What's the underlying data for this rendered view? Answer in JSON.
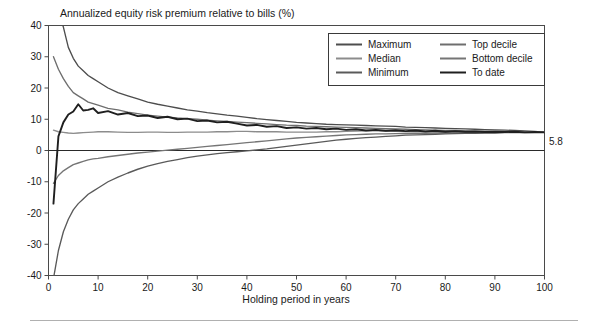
{
  "figure": {
    "title": "Annualized equity risk premium relative to bills (%)",
    "footer_rule": true
  },
  "chart_data": {
    "type": "line",
    "title": "Annualized equity risk premium relative to bills (%)",
    "xlabel": "Holding period in years",
    "ylabel": "",
    "xlim": [
      0,
      100
    ],
    "ylim": [
      -40,
      40
    ],
    "grid": false,
    "legend_position": "top-right",
    "xticks": [
      0,
      10,
      20,
      30,
      40,
      50,
      60,
      70,
      80,
      90,
      100
    ],
    "yticks": [
      -40,
      -30,
      -20,
      -10,
      0,
      10,
      20,
      30,
      40
    ],
    "xtick_labels": [
      "0",
      "10",
      "20",
      "30",
      "40",
      "50",
      "60",
      "70",
      "80",
      "90",
      "100"
    ],
    "ytick_labels": [
      "-40",
      "-30",
      "-20",
      "-10",
      "0",
      "10",
      "20",
      "30",
      "40"
    ],
    "annotations": [
      {
        "text": "5.8",
        "x": 100,
        "y": 5.8,
        "position": "right-of-axis"
      }
    ],
    "x": [
      1,
      2,
      3,
      4,
      5,
      6,
      7,
      8,
      9,
      10,
      12,
      14,
      16,
      18,
      20,
      22,
      24,
      26,
      28,
      30,
      32,
      34,
      36,
      38,
      40,
      42,
      44,
      46,
      48,
      50,
      52,
      54,
      56,
      58,
      60,
      62,
      64,
      66,
      68,
      70,
      72,
      74,
      76,
      78,
      80,
      82,
      84,
      86,
      88,
      90,
      92,
      94,
      96,
      98,
      100
    ],
    "series": [
      {
        "name": "Maximum",
        "color": "#4d4d4d",
        "values": [
          57.0,
          44.0,
          39.5,
          33.0,
          29.5,
          27.0,
          25.5,
          24.0,
          23.0,
          22.0,
          20.0,
          18.5,
          17.5,
          16.5,
          15.5,
          14.8,
          14.2,
          13.6,
          13.0,
          12.6,
          12.1,
          11.7,
          11.3,
          11.0,
          10.6,
          10.2,
          9.9,
          9.6,
          9.3,
          9.0,
          8.8,
          8.6,
          8.4,
          8.3,
          8.2,
          8.1,
          8.0,
          7.9,
          7.8,
          7.7,
          7.5,
          7.4,
          7.3,
          7.2,
          7.1,
          7.0,
          6.9,
          6.8,
          6.7,
          6.6,
          6.5,
          6.4,
          6.3,
          6.1,
          5.9
        ]
      },
      {
        "name": "Top decile",
        "color": "#6e6e6e",
        "values": [
          30.0,
          26.0,
          23.0,
          20.5,
          18.5,
          17.5,
          16.5,
          15.5,
          15.0,
          14.5,
          13.5,
          13.0,
          12.3,
          11.8,
          11.3,
          11.0,
          10.7,
          10.4,
          10.2,
          10.0,
          9.7,
          9.5,
          9.3,
          9.1,
          8.9,
          8.7,
          8.5,
          8.3,
          8.1,
          8.0,
          7.8,
          7.7,
          7.6,
          7.5,
          7.4,
          7.3,
          7.2,
          7.1,
          7.0,
          6.9,
          6.8,
          6.7,
          6.6,
          6.5,
          6.4,
          6.4,
          6.3,
          6.2,
          6.2,
          6.1,
          6.1,
          6.0,
          6.0,
          5.9,
          5.9
        ]
      },
      {
        "name": "Median",
        "color": "#8c8c8c",
        "values": [
          6.5,
          6.0,
          5.8,
          5.6,
          5.5,
          5.6,
          5.7,
          5.8,
          5.9,
          6.0,
          6.0,
          5.9,
          5.8,
          5.8,
          5.9,
          5.9,
          5.8,
          5.8,
          5.9,
          5.9,
          5.9,
          6.0,
          6.0,
          6.1,
          6.1,
          6.0,
          6.0,
          6.0,
          5.9,
          5.9,
          5.9,
          5.9,
          6.0,
          6.0,
          6.1,
          6.2,
          6.3,
          6.3,
          6.2,
          6.1,
          6.0,
          6.0,
          6.0,
          6.0,
          5.9,
          5.9,
          5.9,
          5.9,
          5.9,
          5.8,
          5.8,
          5.8,
          5.8,
          5.8,
          5.8
        ]
      },
      {
        "name": "Bottom decile",
        "color": "#757575",
        "values": [
          -10.5,
          -8.0,
          -6.5,
          -5.5,
          -4.5,
          -4.0,
          -3.5,
          -3.0,
          -2.7,
          -2.5,
          -2.0,
          -1.6,
          -1.2,
          -0.8,
          -0.5,
          -0.2,
          0.1,
          0.4,
          0.7,
          1.0,
          1.3,
          1.6,
          1.9,
          2.2,
          2.5,
          2.8,
          3.1,
          3.4,
          3.7,
          4.0,
          4.2,
          4.4,
          4.6,
          4.8,
          5.0,
          5.1,
          5.2,
          5.3,
          5.3,
          5.4,
          5.4,
          5.5,
          5.5,
          5.6,
          5.6,
          5.6,
          5.7,
          5.7,
          5.7,
          5.7,
          5.8,
          5.8,
          5.8,
          5.8,
          5.8
        ]
      },
      {
        "name": "Minimum",
        "color": "#5a5a5a",
        "values": [
          -41.0,
          -32.0,
          -26.0,
          -22.0,
          -19.0,
          -17.0,
          -15.5,
          -14.0,
          -13.0,
          -12.0,
          -10.0,
          -8.5,
          -7.2,
          -6.0,
          -5.0,
          -4.2,
          -3.5,
          -2.9,
          -2.3,
          -1.8,
          -1.4,
          -1.0,
          -0.7,
          -0.4,
          -0.1,
          0.2,
          0.5,
          0.9,
          1.3,
          1.7,
          2.1,
          2.5,
          2.9,
          3.3,
          3.6,
          3.9,
          4.1,
          4.3,
          4.5,
          4.7,
          4.9,
          5.0,
          5.1,
          5.2,
          5.3,
          5.4,
          5.5,
          5.5,
          5.6,
          5.6,
          5.7,
          5.7,
          5.7,
          5.8,
          5.8
        ]
      },
      {
        "name": "To date",
        "color": "#1f1f1f",
        "values": [
          -17.0,
          4.5,
          9.0,
          11.5,
          12.5,
          14.8,
          12.8,
          13.0,
          13.5,
          12.0,
          12.6,
          11.5,
          12.0,
          11.0,
          11.2,
          10.4,
          10.8,
          10.0,
          10.2,
          9.4,
          9.6,
          9.0,
          9.2,
          8.6,
          8.0,
          8.2,
          7.6,
          7.8,
          7.2,
          7.4,
          7.0,
          7.2,
          6.8,
          7.0,
          6.6,
          6.8,
          6.4,
          6.6,
          6.3,
          6.5,
          6.2,
          6.4,
          6.1,
          6.3,
          6.0,
          6.2,
          6.0,
          6.1,
          5.9,
          6.0,
          5.9,
          6.0,
          5.8,
          5.9,
          5.8
        ]
      }
    ],
    "legend": [
      {
        "label": "Maximum",
        "color": "#4d4d4d",
        "column": 0
      },
      {
        "label": "Median",
        "color": "#8c8c8c",
        "column": 0
      },
      {
        "label": "Minimum",
        "color": "#5a5a5a",
        "column": 0
      },
      {
        "label": "Top decile",
        "color": "#6e6e6e",
        "column": 1
      },
      {
        "label": "Bottom decile",
        "color": "#757575",
        "column": 1
      },
      {
        "label": "To date",
        "color": "#1f1f1f",
        "column": 1
      }
    ]
  }
}
